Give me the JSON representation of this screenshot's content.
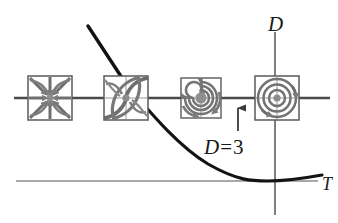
{
  "figure": {
    "title_fragment": "",
    "axes": {
      "vertical_label": "D",
      "horizontal_label": "T",
      "horizontal_axis_y": 98,
      "vertical_axis_x": 275,
      "baseline_y": 181
    },
    "curve": {
      "label_text": "D",
      "label_equals": "=",
      "label_value": "3",
      "full_label": "D = 3",
      "description": "parabola tangent to T axis"
    },
    "pointer_arrow": {
      "name": "up-arrow-marker",
      "x": 238,
      "y_base": 130,
      "y_tip": 103
    },
    "leader_line": {
      "name": "leader-line",
      "x1": 88,
      "y1": 42,
      "x2": 126,
      "y2": 84
    },
    "phase_portraits": [
      {
        "id": "stable-node",
        "label": "stable node",
        "cx": 50,
        "cy": 98,
        "size": 44
      },
      {
        "id": "degenerate-node",
        "label": "degenerate node",
        "cx": 126,
        "cy": 98,
        "size": 44
      },
      {
        "id": "spiral-sink",
        "label": "spiral sink",
        "cx": 201,
        "cy": 98,
        "size": 40
      },
      {
        "id": "center",
        "label": "center",
        "cx": 277,
        "cy": 98,
        "size": 44
      }
    ],
    "colors": {
      "axis": "#4a4a4a",
      "curve": "#111111",
      "portrait_stroke": "#6e6e6e",
      "portrait_fill": "#9a9a9a",
      "box": "#5a5a5a",
      "text": "#1a1a1a"
    }
  }
}
